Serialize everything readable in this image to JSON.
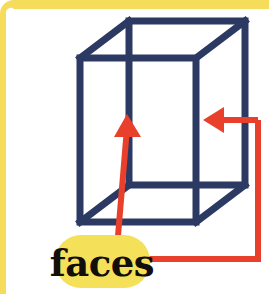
{
  "figure": {
    "type": "labeled-geometry-illustration",
    "canvas": {
      "width": 269,
      "height": 294
    },
    "background_color": "#ffffff"
  },
  "frame": {
    "name": "page-border",
    "color": "#f6dc5b",
    "top_band_height": 9,
    "left_band_width": 6,
    "corner_radius": 14,
    "edges_present": [
      "top",
      "left"
    ]
  },
  "shape": {
    "name": "cube",
    "style": "wireframe-oblique",
    "stroke_color": "#2c3a63",
    "stroke_width": 7,
    "fill": "none",
    "front_face": {
      "x": 80,
      "y": 58,
      "width": 116,
      "height": 164
    },
    "depth_offset": {
      "dx": 49,
      "dy": -37
    },
    "vertices": {
      "front_top_left": [
        80,
        58
      ],
      "front_top_right": [
        196,
        58
      ],
      "front_bottom_right": [
        196,
        222
      ],
      "front_bottom_left": [
        80,
        222
      ],
      "back_top_left": [
        129,
        21
      ],
      "back_top_right": [
        245,
        21
      ],
      "back_bottom_right": [
        245,
        185
      ],
      "back_bottom_left": [
        129,
        185
      ]
    },
    "face_count": 6,
    "visible_face_count": 3
  },
  "annotations": {
    "accent_color": "#e8402a",
    "stroke_width": 6,
    "arrows": [
      {
        "name": "arrow-to-front-face",
        "direction": "up",
        "tip": [
          127,
          117
        ],
        "tail": [
          117,
          243
        ],
        "points_at": "front-face"
      },
      {
        "name": "arrow-to-right-face",
        "direction": "left",
        "tip": [
          205,
          120
        ],
        "tail": [
          258,
          120
        ],
        "points_at": "right-face"
      }
    ],
    "connector": {
      "name": "label-connector",
      "from": "label-pill",
      "path": [
        [
          148,
          259
        ],
        [
          258,
          259
        ],
        [
          258,
          120
        ]
      ]
    }
  },
  "label": {
    "name": "faces-label",
    "text": "faces",
    "text_color": "#120f0a",
    "pill_color": "#f5e05a",
    "pill": {
      "x": 55,
      "y": 235,
      "width": 95,
      "height": 53,
      "radius": 26
    },
    "text_anchor": [
      102,
      275
    ]
  }
}
